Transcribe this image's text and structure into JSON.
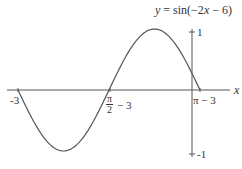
{
  "chart_data": {
    "type": "line",
    "title": "y = sin(−2x − 6)",
    "function": "sin(-2x - 6)",
    "xlabel": "x",
    "ylabel": "",
    "x_ticks": [
      {
        "value": -3,
        "label": "-3"
      },
      {
        "value": -1.4292,
        "label": "π/2 − 3"
      },
      {
        "value": 0.1416,
        "label": "π − 3"
      }
    ],
    "y_ticks": [
      {
        "value": 1,
        "label": "1"
      },
      {
        "value": -1,
        "label": "-1"
      }
    ],
    "xlim": [
      -3,
      0.1416
    ],
    "ylim": [
      -1,
      1
    ],
    "grid": false,
    "legend": null,
    "key_points": [
      {
        "x": -3,
        "y": 0
      },
      {
        "x": -2.2146,
        "y": -1
      },
      {
        "x": -1.4292,
        "y": 0
      },
      {
        "x": -0.6438,
        "y": 1
      },
      {
        "x": 0,
        "y": 0.2794
      },
      {
        "x": 0.1416,
        "y": 0
      }
    ],
    "colors": {
      "curve": "#555555",
      "axes": "#555555",
      "text": "#333333"
    }
  },
  "labels": {
    "title_y": "y",
    "title_rest": " = sin(−2",
    "title_x": "x",
    "title_end": " − 6)",
    "x_axis": "x",
    "tick_neg3": "-3",
    "tick_pi_half_num": "π",
    "tick_pi_half_den": "2",
    "tick_pi_half_rest": "− 3",
    "tick_pi_minus3": "π − 3",
    "tick_y1": "1",
    "tick_yneg1": "-1"
  }
}
